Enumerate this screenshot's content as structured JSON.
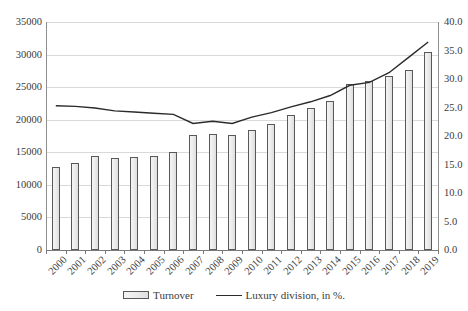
{
  "chart_data": {
    "type": "bar",
    "title": "",
    "subtitle": "",
    "xlabel": "",
    "ylabel": "",
    "grid": true,
    "legend_position": "bottom",
    "categories": [
      "2000",
      "2001",
      "2002",
      "2003",
      "2004",
      "2005",
      "2006",
      "2007",
      "2008",
      "2009",
      "2010",
      "2011",
      "2012",
      "2013",
      "2014",
      "2015",
      "2016",
      "2017",
      "2018",
      "2019"
    ],
    "axes": {
      "left": {
        "label": "",
        "ylim": [
          0,
          35000
        ],
        "ticks": [
          "0",
          "5000",
          "10000",
          "15000",
          "20000",
          "25000",
          "30000",
          "35000"
        ],
        "tick_values": [
          0,
          5000,
          10000,
          15000,
          20000,
          25000,
          30000,
          35000
        ]
      },
      "right": {
        "label": "",
        "ylim": [
          0,
          40
        ],
        "ticks": [
          "0.0",
          "5.0",
          "10.0",
          "15.0",
          "20.0",
          "25.0",
          "30.0",
          "35.0",
          "40.0"
        ],
        "tick_values": [
          0,
          5,
          10,
          15,
          20,
          25,
          30,
          35,
          40
        ]
      }
    },
    "series": [
      {
        "name": "Turnover",
        "type": "bar",
        "axis": "left",
        "values": [
          12700,
          13400,
          14400,
          14200,
          14300,
          14400,
          15000,
          17700,
          17800,
          17700,
          18500,
          19300,
          20800,
          21800,
          22900,
          25500,
          26000,
          26700,
          27700,
          30400
        ]
      },
      {
        "name": "Luxury division, in %.",
        "type": "line",
        "axis": "right",
        "values": [
          25.3,
          25.2,
          24.9,
          24.4,
          24.2,
          24.0,
          23.8,
          22.2,
          22.6,
          22.2,
          23.3,
          24.1,
          25.1,
          26.0,
          27.1,
          28.9,
          29.4,
          31.1,
          33.8,
          36.5
        ]
      }
    ],
    "legend": [
      {
        "label": "Turnover",
        "marker": "bar-swatch"
      },
      {
        "label": "Luxury division, in %.",
        "marker": "line-swatch"
      }
    ]
  }
}
